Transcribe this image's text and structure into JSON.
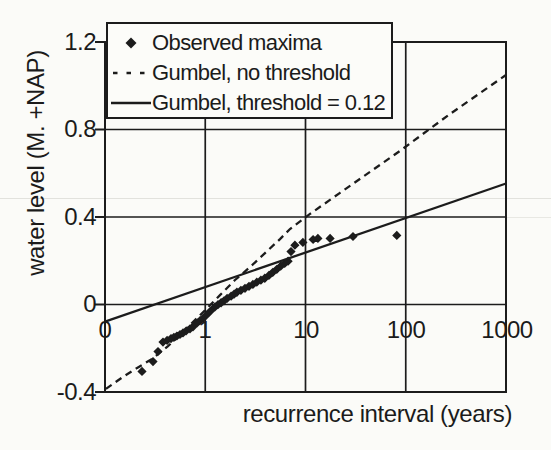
{
  "figure": {
    "background": "#fbfbf8",
    "ink_color": "#1c1c1c"
  },
  "chart_data": {
    "type": "scatter",
    "title": "",
    "xlabel": "recurrence interval (years)",
    "ylabel": "water level (M. +NAP)",
    "x_scale": "log",
    "xlim": [
      0.1,
      1000
    ],
    "ylim": [
      -0.4,
      1.2
    ],
    "grid": true,
    "x_ticks": [
      {
        "value": 0.1,
        "label": "0"
      },
      {
        "value": 1,
        "label": "1"
      },
      {
        "value": 10,
        "label": "10"
      },
      {
        "value": 100,
        "label": "100"
      },
      {
        "value": 1000,
        "label": "1000"
      }
    ],
    "y_ticks": [
      {
        "value": 1.2,
        "label": "1.2"
      },
      {
        "value": 0.8,
        "label": "0.8"
      },
      {
        "value": 0.4,
        "label": "0.4"
      },
      {
        "value": 0,
        "label": "0"
      },
      {
        "value": -0.4,
        "label": "-0.4"
      }
    ],
    "legend": {
      "position": "top-left",
      "entries": [
        {
          "label": "Observed maxima",
          "marker": "diamond"
        },
        {
          "label": "Gumbel, no threshold",
          "marker": "dashed-line"
        },
        {
          "label": "Gumbel, threshold = 0.12",
          "marker": "solid-line"
        }
      ]
    },
    "series": [
      {
        "name": "Observed maxima",
        "type": "scatter",
        "marker": "diamond",
        "color": "#1c1c1c",
        "points": [
          [
            0.234,
            -0.306
          ],
          [
            0.301,
            -0.261
          ],
          [
            0.338,
            -0.215
          ],
          [
            0.379,
            -0.172
          ],
          [
            0.416,
            -0.164
          ],
          [
            0.455,
            -0.156
          ],
          [
            0.487,
            -0.15
          ],
          [
            0.522,
            -0.144
          ],
          [
            0.56,
            -0.137
          ],
          [
            0.6,
            -0.13
          ],
          [
            0.644,
            -0.121
          ],
          [
            0.704,
            -0.111
          ],
          [
            0.754,
            -0.102
          ],
          [
            0.83,
            -0.084
          ],
          [
            0.887,
            -0.074
          ],
          [
            0.95,
            -0.063
          ],
          [
            1.02,
            -0.05
          ],
          [
            1.09,
            -0.037
          ],
          [
            1.17,
            -0.023
          ],
          [
            1.25,
            -0.011
          ],
          [
            1.34,
            -0.001
          ],
          [
            1.44,
            0.008
          ],
          [
            1.54,
            0.017
          ],
          [
            1.65,
            0.028
          ],
          [
            1.81,
            0.038
          ],
          [
            1.94,
            0.047
          ],
          [
            2.07,
            0.056
          ],
          [
            2.27,
            0.065
          ],
          [
            2.49,
            0.074
          ],
          [
            2.73,
            0.083
          ],
          [
            2.99,
            0.092
          ],
          [
            3.27,
            0.102
          ],
          [
            3.59,
            0.111
          ],
          [
            3.93,
            0.12
          ],
          [
            4.31,
            0.133
          ],
          [
            4.72,
            0.147
          ],
          [
            5.17,
            0.161
          ],
          [
            5.66,
            0.175
          ],
          [
            6.2,
            0.188
          ],
          [
            6.7,
            0.198
          ],
          [
            7.16,
            0.242
          ],
          [
            7.84,
            0.271
          ],
          [
            9.43,
            0.284
          ],
          [
            11.9,
            0.297
          ],
          [
            13.3,
            0.302
          ],
          [
            17.6,
            0.302
          ],
          [
            29.8,
            0.311
          ],
          [
            81.5,
            0.316
          ]
        ]
      },
      {
        "name": "Gumbel, no threshold",
        "type": "line",
        "style": "dashed",
        "color": "#1c1c1c",
        "points": [
          [
            0.102,
            -0.386
          ],
          [
            0.151,
            -0.331
          ],
          [
            0.209,
            -0.29
          ],
          [
            0.294,
            -0.249
          ],
          [
            0.425,
            -0.19
          ],
          [
            0.6,
            -0.126
          ],
          [
            0.791,
            -0.071
          ],
          [
            0.994,
            -0.027
          ],
          [
            1.403,
            0.043
          ],
          [
            1.981,
            0.112
          ],
          [
            2.795,
            0.171
          ],
          [
            3.945,
            0.235
          ],
          [
            5.569,
            0.299
          ],
          [
            7.0,
            0.345
          ],
          [
            11.09,
            0.414
          ],
          [
            22.09,
            0.51
          ],
          [
            44.03,
            0.606
          ],
          [
            87.7,
            0.702
          ],
          [
            276.6,
            0.871
          ],
          [
            1000,
            1.049
          ]
        ]
      },
      {
        "name": "Gumbel, threshold = 0.12",
        "type": "line",
        "style": "solid",
        "color": "#1c1c1c",
        "points": [
          [
            0.1,
            -0.078
          ],
          [
            1000,
            0.553
          ]
        ]
      }
    ]
  }
}
